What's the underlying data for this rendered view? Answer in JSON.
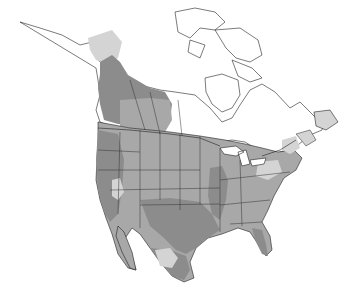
{
  "map": {
    "title": "",
    "region": "North America",
    "type": "species range map",
    "colors": {
      "background": "#ffffff",
      "land_outside_range": "#ffffff",
      "range_light": "#d4d4d4",
      "range_medium": "#a8a8a8",
      "range_dark": "#8c8c8c",
      "borders": "#222222"
    },
    "shading_levels": [
      {
        "name": "light",
        "color": "#d4d4d4",
        "areas": [
          "western Alaska / Yukon",
          "Newfoundland",
          "Maritimes",
          "Great Basin patches",
          "northern Mexico plateau",
          "Pennsylvania / West Virginia",
          "New England"
        ]
      },
      {
        "name": "medium",
        "color": "#a8a8a8",
        "areas": [
          "Great Plains",
          "Canadian Prairies",
          "southeastern US",
          "Great Lakes"
        ]
      },
      {
        "name": "dark",
        "color": "#8c8c8c",
        "areas": [
          "Pacific coast",
          "northern Rockies / BC",
          "Texas / Southwest",
          "Mississippi valley",
          "Florida",
          "Mexico"
        ]
      }
    ]
  }
}
